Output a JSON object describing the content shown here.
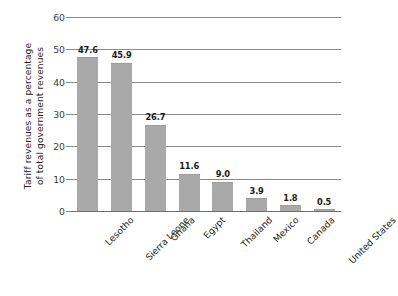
{
  "chart_data": {
    "type": "bar",
    "title": "",
    "subtitle": "",
    "xlabel": "",
    "ylabel": "Tariff revenues as a percentage of total government revenues",
    "ylabel_lines": [
      "Tariff revenues as a percentage",
      "of total government revenues"
    ],
    "categories": [
      "Lesotho",
      "Sierra Leone",
      "Ghana",
      "Egypt",
      "Thailand",
      "Mexico",
      "Canada",
      "United States"
    ],
    "values": [
      47.6,
      45.9,
      26.7,
      11.6,
      9.0,
      3.9,
      1.8,
      0.5
    ],
    "value_labels": [
      "47.6",
      "45.9",
      "26.7",
      "11.6",
      "9.0",
      "3.9",
      "1.8",
      "0.5"
    ],
    "ylim": [
      0,
      60
    ],
    "yticks": [
      0,
      10,
      20,
      30,
      40,
      50,
      60
    ],
    "ytick_labels": [
      "0",
      "10",
      "20",
      "30",
      "40",
      "50",
      "60"
    ],
    "grid": "horizontal",
    "legend": "none",
    "legend_position": "none",
    "bar_color": "#a9a9a9",
    "gridline_color": "#8a8a8a",
    "text_color": "#231f20",
    "background": "#ffffff",
    "xtick_label_rotation": -45
  }
}
